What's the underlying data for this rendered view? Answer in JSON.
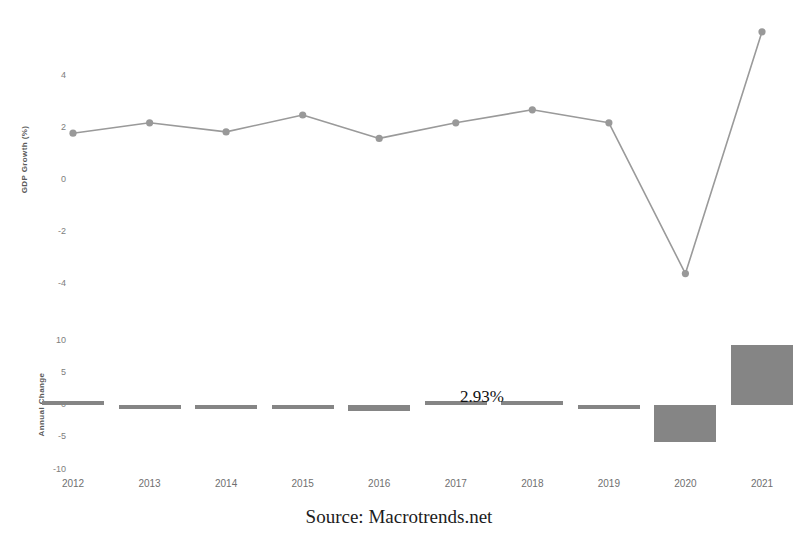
{
  "source_note": "Source: Macrotrends.net",
  "annotation": {
    "text": "2.93%",
    "x": 500,
    "y": 404
  },
  "top_chart": {
    "ylabel": "GDP Growth (%)",
    "ytick_labels": [
      "4",
      "2",
      "0",
      "-2",
      "-4"
    ],
    "ytick_values": [
      4,
      2,
      0,
      -2,
      -4
    ]
  },
  "bottom_chart": {
    "ylabel": "Annual Change",
    "ytick_labels": [
      "10",
      "5",
      "0",
      "-5",
      "-10"
    ],
    "ytick_values": [
      10,
      5,
      0,
      -5,
      -10
    ]
  },
  "xtick_labels": [
    "2012",
    "2013",
    "2014",
    "2015",
    "2016",
    "2017",
    "2018",
    "2019",
    "2020",
    "2021"
  ],
  "colors": {
    "line": "#9a9a9a",
    "marker": "#999999",
    "bar": "#858585",
    "tick_text": "#7d7d7d",
    "axis_title": "#5a5a5a",
    "source_text": "#1c1c1c",
    "background": "#ffffff"
  },
  "chart_data": [
    {
      "type": "line",
      "title": "",
      "xlabel": "",
      "ylabel": "GDP Growth (%)",
      "categories": [
        "2012",
        "2013",
        "2014",
        "2015",
        "2016",
        "2017",
        "2018",
        "2019",
        "2020",
        "2021"
      ],
      "values": [
        1.8,
        2.2,
        1.85,
        2.5,
        1.6,
        2.2,
        2.7,
        2.2,
        -3.6,
        5.7
      ],
      "ylim": [
        -5,
        6
      ],
      "yticks": [
        4,
        2,
        0,
        -2,
        -4
      ],
      "grid": false,
      "legend": "none",
      "markers": true
    },
    {
      "type": "bar",
      "title": "",
      "xlabel": "",
      "ylabel": "Annual Change",
      "categories": [
        "2012",
        "2013",
        "2014",
        "2015",
        "2016",
        "2017",
        "2018",
        "2019",
        "2020",
        "2021"
      ],
      "values": [
        0.25,
        -0.3,
        -0.2,
        -0.15,
        -0.9,
        0.3,
        0.2,
        -0.5,
        -5.8,
        9.3
      ],
      "ylim": [
        -10,
        10
      ],
      "yticks": [
        10,
        5,
        0,
        -5,
        -10
      ],
      "grid": false,
      "legend": "none",
      "annotations": [
        {
          "label": "2.93%",
          "near_category": "2017"
        }
      ]
    }
  ]
}
